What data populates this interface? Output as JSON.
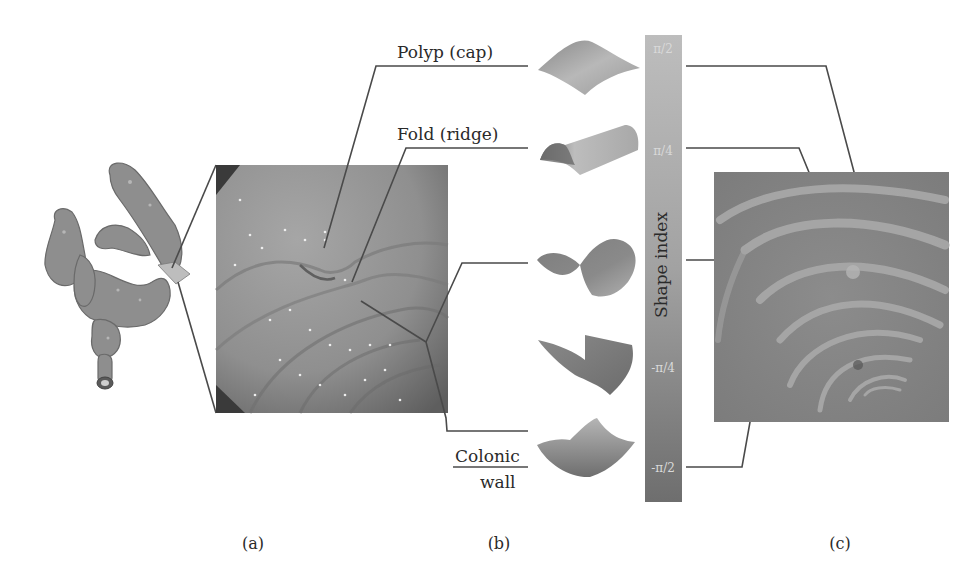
{
  "figure": {
    "panels": [
      {
        "id": "a",
        "caption": "(a)",
        "content": "3D colon rendering with endoscopic view"
      },
      {
        "id": "b",
        "caption": "(b)",
        "content": "Shape index surface primitives"
      },
      {
        "id": "c",
        "caption": "(c)",
        "content": "Shape index map of colon surface"
      }
    ],
    "annotations": {
      "polyp": "Polyp (cap)",
      "fold": "Fold (ridge)",
      "wall_line1": "Colonic",
      "wall_line2": "wall"
    },
    "colorbar": {
      "title": "Shape index",
      "ticks": [
        "π/2",
        "π/4",
        "-π/4",
        "-π/2"
      ],
      "top_color": "#b9b9b9",
      "bottom_color": "#6f6f6f"
    },
    "shapes": [
      "cap",
      "ridge",
      "saddle",
      "rut",
      "cup"
    ]
  }
}
